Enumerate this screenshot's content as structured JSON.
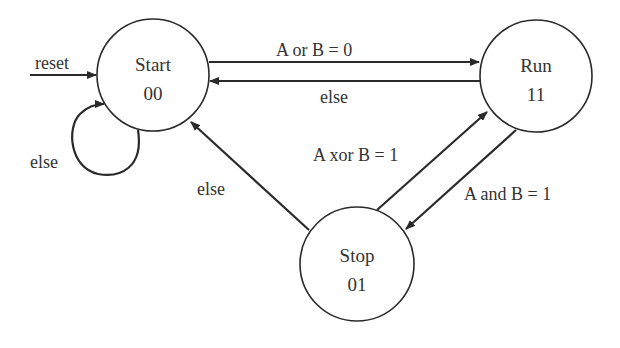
{
  "diagram": {
    "type": "finite-state-machine",
    "colors": {
      "background": "#ffffff",
      "stroke": "#2a2a2a",
      "text": "#333333"
    },
    "states": [
      {
        "id": "start",
        "name": "Start",
        "code": "00"
      },
      {
        "id": "run",
        "name": "Run",
        "code": "11"
      },
      {
        "id": "stop",
        "name": "Stop",
        "code": "01"
      }
    ],
    "transitions": [
      {
        "id": "reset",
        "from": "",
        "to": "start",
        "label": "reset"
      },
      {
        "id": "start-self",
        "from": "start",
        "to": "start",
        "label": "else"
      },
      {
        "id": "start-run",
        "from": "start",
        "to": "run",
        "label": "A or B = 0"
      },
      {
        "id": "run-start",
        "from": "run",
        "to": "start",
        "label": "else"
      },
      {
        "id": "stop-run",
        "from": "stop",
        "to": "run",
        "label": "A xor B = 1"
      },
      {
        "id": "run-stop",
        "from": "run",
        "to": "stop",
        "label": "A and B = 1"
      },
      {
        "id": "stop-start",
        "from": "stop",
        "to": "start",
        "label": "else"
      }
    ]
  }
}
